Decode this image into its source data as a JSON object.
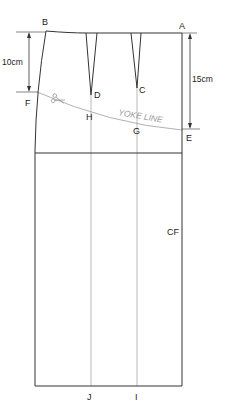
{
  "diagram": {
    "type": "skirt-pattern-yoke-draft",
    "points": {
      "A": "A",
      "B": "B",
      "C": "C",
      "D": "D",
      "E": "E",
      "F": "F",
      "G": "G",
      "H": "H",
      "I": "I",
      "J": "J"
    },
    "labels": {
      "center_front": "CF",
      "yoke_line": "YOKE LINE"
    },
    "dimensions": {
      "left": "10cm",
      "right": "15cm"
    },
    "icons": [
      "scissors-icon"
    ],
    "colors": {
      "outline": "#333333",
      "guide": "#a8a8a8",
      "yoke": "#a8a8a8"
    }
  }
}
